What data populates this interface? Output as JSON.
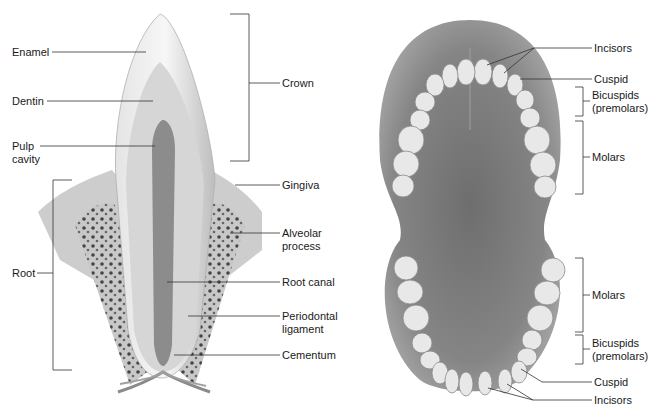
{
  "tooth_section": {
    "labels_left": {
      "enamel": "Enamel",
      "dentin": "Dentin",
      "pulp_cavity_1": "Pulp",
      "pulp_cavity_2": "cavity",
      "root": "Root"
    },
    "labels_right": {
      "crown": "Crown",
      "gingiva": "Gingiva",
      "alveolar_1": "Alveolar",
      "alveolar_2": "process",
      "root_canal": "Root canal",
      "periodontal_1": "Periodontal",
      "periodontal_2": "ligament",
      "cementum": "Cementum"
    }
  },
  "dental_arch": {
    "upper": {
      "incisors": "Incisors",
      "cuspid": "Cuspid",
      "bicuspids_1": "Bicuspids",
      "bicuspids_2": "(premolars)",
      "molars": "Molars"
    },
    "lower": {
      "molars": "Molars",
      "bicuspids_1": "Bicuspids",
      "bicuspids_2": "(premolars)",
      "cuspid": "Cuspid",
      "incisors": "Incisors"
    }
  },
  "colors": {
    "enamel": "#f2f2f2",
    "dentin": "#d9d9d9",
    "pulp": "#8a8a8a",
    "bone": "#c4c4c4",
    "gingiva": "#cfcfcf",
    "palate": "#7a7a7a",
    "tooth": "#e6e6e6",
    "line": "#333333"
  }
}
